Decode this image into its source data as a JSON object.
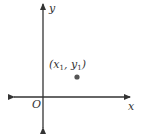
{
  "diagram": {
    "x_axis_label": "x",
    "y_axis_label": "y",
    "origin_label": "O",
    "point": {
      "open_paren": "(",
      "x_var": "x",
      "x_sub": "1",
      "comma": ", ",
      "y_var": "y",
      "y_sub": "1",
      "close_paren": ")"
    },
    "colors": {
      "stroke": "#333333",
      "point": "#555555"
    }
  }
}
